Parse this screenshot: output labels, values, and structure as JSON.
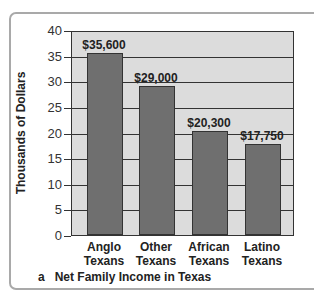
{
  "chart_data": {
    "type": "bar",
    "title": "Net Family Income in Texas",
    "caption_letter": "a",
    "xlabel": "",
    "ylabel": "Thousands of Dollars",
    "ylim": [
      0,
      40
    ],
    "yticks": [
      0,
      5,
      10,
      15,
      20,
      25,
      30,
      35,
      40
    ],
    "grid": true,
    "categories": [
      "Anglo Texans",
      "Other Texans",
      "African Texans",
      "Latino Texans"
    ],
    "category_lines": [
      [
        "Anglo",
        "Texans"
      ],
      [
        "Other",
        "Texans"
      ],
      [
        "African",
        "Texans"
      ],
      [
        "Latino",
        "Texans"
      ]
    ],
    "values": [
      35.6,
      29.0,
      20.3,
      17.75
    ],
    "data_labels": [
      "$35,600",
      "$29,000",
      "$20,300",
      "$17,750"
    ],
    "colors": {
      "bar": "#6f6f6f",
      "plot_bg": "#dcdcdc",
      "frame": "#a9a9a9"
    }
  }
}
